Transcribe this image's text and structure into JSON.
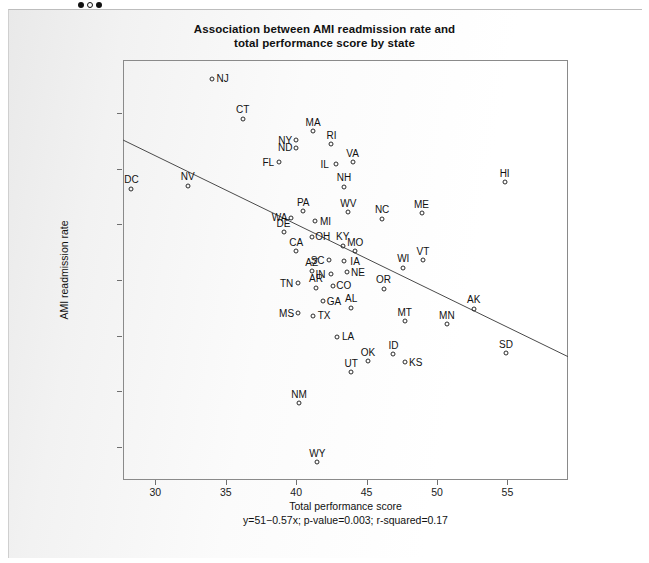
{
  "window": {
    "nav_dots": [
      "filled",
      "hollow",
      "filled"
    ]
  },
  "chart": {
    "title_line1": "Association between AMI readmission rate and",
    "title_line2": "total performance score by state",
    "xlabel": "Total performance score",
    "ylabel": "AMI readmission rate",
    "equation": "y=51−0.57x; p-value=0.003; r-squared=0.17"
  },
  "chart_data": {
    "type": "scatter",
    "title": "Association between AMI readmission rate and total performance score by state",
    "xlabel": "Total performance score",
    "ylabel": "AMI readmission rate",
    "xlim": [
      27.7,
      59.3
    ],
    "ylim": [
      7.0,
      44.8
    ],
    "xticks": [
      30,
      35,
      40,
      45,
      50,
      55
    ],
    "yticks": [
      10,
      15,
      20,
      25,
      30,
      35,
      40
    ],
    "grid": false,
    "legend": null,
    "point_label_field": "state",
    "regression": {
      "equation": "y=51−0.57x; p-value=0.003; r-squared=0.17",
      "intercept": 51,
      "slope": -0.57,
      "p_value": 0.003,
      "r_squared": 0.17,
      "line_x": [
        27.7,
        59.3
      ],
      "line_y": [
        37.6,
        18.1
      ]
    },
    "points": [
      {
        "state": "NJ",
        "x": 34.0,
        "y": 43.1,
        "label_pos": "right"
      },
      {
        "state": "CT",
        "x": 36.2,
        "y": 39.5,
        "label_pos": "above"
      },
      {
        "state": "MA",
        "x": 41.2,
        "y": 38.4,
        "label_pos": "above"
      },
      {
        "state": "NY",
        "x": 40.0,
        "y": 37.6,
        "label_pos": "left"
      },
      {
        "state": "RI",
        "x": 42.5,
        "y": 37.2,
        "label_pos": "above"
      },
      {
        "state": "ND",
        "x": 40.0,
        "y": 36.9,
        "label_pos": "left"
      },
      {
        "state": "FL",
        "x": 38.8,
        "y": 35.6,
        "label_pos": "left"
      },
      {
        "state": "IL",
        "x": 42.8,
        "y": 35.4,
        "label_pos": "left"
      },
      {
        "state": "VA",
        "x": 44.0,
        "y": 35.6,
        "label_pos": "above"
      },
      {
        "state": "HI",
        "x": 54.8,
        "y": 33.8,
        "label_pos": "above"
      },
      {
        "state": "DC",
        "x": 28.3,
        "y": 33.2,
        "label_pos": "above"
      },
      {
        "state": "NV",
        "x": 32.3,
        "y": 33.5,
        "label_pos": "above"
      },
      {
        "state": "NH",
        "x": 43.4,
        "y": 33.4,
        "label_pos": "above"
      },
      {
        "state": "ME",
        "x": 48.9,
        "y": 31.0,
        "label_pos": "above"
      },
      {
        "state": "NC",
        "x": 46.1,
        "y": 30.5,
        "label_pos": "above"
      },
      {
        "state": "PA",
        "x": 40.5,
        "y": 31.2,
        "label_pos": "above"
      },
      {
        "state": "WV",
        "x": 43.7,
        "y": 31.1,
        "label_pos": "above"
      },
      {
        "state": "WA",
        "x": 39.6,
        "y": 30.6,
        "label_pos": "left"
      },
      {
        "state": "MI",
        "x": 41.3,
        "y": 30.3,
        "label_pos": "right"
      },
      {
        "state": "DE",
        "x": 39.1,
        "y": 29.3,
        "label_pos": "above"
      },
      {
        "state": "OH",
        "x": 41.1,
        "y": 28.9,
        "label_pos": "right"
      },
      {
        "state": "CA",
        "x": 40.0,
        "y": 27.6,
        "label_pos": "above"
      },
      {
        "state": "KY",
        "x": 43.3,
        "y": 28.1,
        "label_pos": "above"
      },
      {
        "state": "MO",
        "x": 44.2,
        "y": 27.6,
        "label_pos": "above"
      },
      {
        "state": "SC",
        "x": 42.3,
        "y": 26.8,
        "label_pos": "left"
      },
      {
        "state": "IA",
        "x": 43.4,
        "y": 26.7,
        "label_pos": "right"
      },
      {
        "state": "VT",
        "x": 49.0,
        "y": 26.8,
        "label_pos": "above"
      },
      {
        "state": "WI",
        "x": 47.6,
        "y": 26.1,
        "label_pos": "above"
      },
      {
        "state": "AZ",
        "x": 41.1,
        "y": 25.8,
        "label_pos": "above"
      },
      {
        "state": "NE",
        "x": 43.6,
        "y": 25.7,
        "label_pos": "right"
      },
      {
        "state": "IN",
        "x": 42.5,
        "y": 25.5,
        "label_pos": "left"
      },
      {
        "state": "AR",
        "x": 41.4,
        "y": 24.3,
        "label_pos": "above"
      },
      {
        "state": "CO",
        "x": 42.6,
        "y": 24.5,
        "label_pos": "right"
      },
      {
        "state": "TN",
        "x": 40.1,
        "y": 24.7,
        "label_pos": "left"
      },
      {
        "state": "OR",
        "x": 46.2,
        "y": 24.2,
        "label_pos": "above"
      },
      {
        "state": "GA",
        "x": 41.9,
        "y": 23.1,
        "label_pos": "right"
      },
      {
        "state": "AL",
        "x": 43.9,
        "y": 22.5,
        "label_pos": "above"
      },
      {
        "state": "AK",
        "x": 52.6,
        "y": 22.4,
        "label_pos": "above"
      },
      {
        "state": "MS",
        "x": 40.1,
        "y": 22.0,
        "label_pos": "left"
      },
      {
        "state": "TX",
        "x": 41.2,
        "y": 21.8,
        "label_pos": "right"
      },
      {
        "state": "MT",
        "x": 47.7,
        "y": 21.3,
        "label_pos": "above"
      },
      {
        "state": "MN",
        "x": 50.7,
        "y": 21.0,
        "label_pos": "above"
      },
      {
        "state": "LA",
        "x": 42.9,
        "y": 19.9,
        "label_pos": "right"
      },
      {
        "state": "SD",
        "x": 54.9,
        "y": 18.4,
        "label_pos": "above"
      },
      {
        "state": "ID",
        "x": 46.9,
        "y": 18.3,
        "label_pos": "above"
      },
      {
        "state": "OK",
        "x": 45.1,
        "y": 17.7,
        "label_pos": "above"
      },
      {
        "state": "KS",
        "x": 47.7,
        "y": 17.6,
        "label_pos": "right"
      },
      {
        "state": "UT",
        "x": 43.9,
        "y": 16.7,
        "label_pos": "above"
      },
      {
        "state": "NM",
        "x": 40.2,
        "y": 13.9,
        "label_pos": "above"
      },
      {
        "state": "WY",
        "x": 41.5,
        "y": 8.6,
        "label_pos": "above"
      }
    ]
  }
}
